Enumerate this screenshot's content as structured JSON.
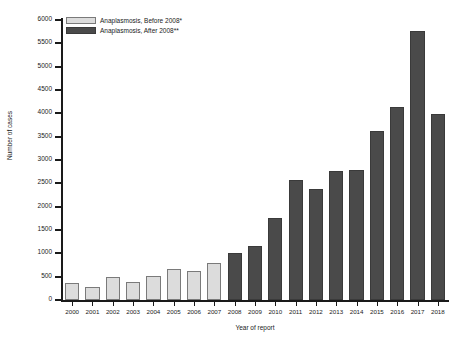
{
  "chart_data": {
    "type": "bar",
    "title": "",
    "xlabel": "Year of report",
    "ylabel": "Number of cases",
    "ylim": [
      0,
      6000
    ],
    "ytick_step": 500,
    "yticks": [
      0,
      500,
      1000,
      1500,
      2000,
      2500,
      3000,
      3500,
      4000,
      4500,
      5000,
      5500,
      6000
    ],
    "grid": false,
    "legend_position": "top-left",
    "categories": [
      "2000",
      "2001",
      "2002",
      "2003",
      "2004",
      "2005",
      "2006",
      "2007",
      "2008",
      "2009",
      "2010",
      "2011",
      "2012",
      "2013",
      "2014",
      "2015",
      "2016",
      "2017",
      "2018"
    ],
    "series": [
      {
        "name": "Anaplasmosis, Before 2008*",
        "color": "#dcdcdc",
        "values": [
          370,
          280,
          500,
          380,
          510,
          670,
          620,
          790,
          null,
          null,
          null,
          null,
          null,
          null,
          null,
          null,
          null,
          null,
          null
        ]
      },
      {
        "name": "Anaplasmosis, After 2008**",
        "color": "#4a4a4a",
        "values": [
          null,
          null,
          null,
          null,
          null,
          null,
          null,
          null,
          1010,
          1160,
          1760,
          2580,
          2380,
          2770,
          2780,
          3620,
          4130,
          5760,
          3990
        ]
      }
    ],
    "values_combined": [
      370,
      280,
      500,
      380,
      510,
      670,
      620,
      790,
      1010,
      1160,
      1760,
      2580,
      2380,
      2770,
      2780,
      3620,
      4130,
      5760,
      3990
    ],
    "series_of_bar": [
      "before",
      "before",
      "before",
      "before",
      "before",
      "before",
      "before",
      "before",
      "after",
      "after",
      "after",
      "after",
      "after",
      "after",
      "after",
      "after",
      "after",
      "after",
      "after"
    ]
  },
  "legend": {
    "items": [
      {
        "label": "Anaplasmosis, Before 2008*",
        "swatch": "before"
      },
      {
        "label": "Anaplasmosis, After 2008**",
        "swatch": "after"
      }
    ]
  },
  "axes": {
    "y_title": "Number of cases",
    "x_title": "Year of report"
  }
}
